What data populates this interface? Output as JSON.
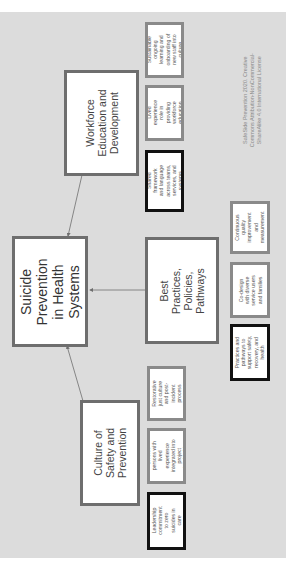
{
  "title": "Suicide Prevention in Health Systems",
  "center": {
    "label": "Suicide Prevention in Health Systems"
  },
  "branches": [
    {
      "label": "Workforce Education and Development",
      "items": [
        {
          "label": "Sustainable ongoing learning and onboarding of new staff into culture",
          "emphasis": false
        },
        {
          "label": "Lived experience role in providing workforce education",
          "emphasis": false
        },
        {
          "label": "Shared framework and language across teams, services, and systems",
          "emphasis": true
        }
      ]
    },
    {
      "label": "Best Practices, Policies, Pathways",
      "items": [
        {
          "label": "Continuous quality improvement and measurement",
          "emphasis": false
        },
        {
          "label": "Co-design with diverse service users and families",
          "emphasis": false
        },
        {
          "label": "Practices and pathways to support safety, recovery, and health",
          "emphasis": true
        }
      ]
    },
    {
      "label": "Culture of Safety and Prevention",
      "items": [
        {
          "label": "Restorative just culture and post-incident process",
          "emphasis": false
        },
        {
          "label": "Diverse persons with lived experience integrated into project leadership",
          "emphasis": false
        },
        {
          "label": "Leadership commitment to zero suicides in care",
          "emphasis": true
        }
      ]
    }
  ],
  "credit": {
    "line1": "SafeSide Prevention 2020. Creative",
    "line2": "Commons Attribution-NonCommercial-",
    "line3": "ShareAlike 4.0 International License"
  },
  "colors": {
    "background": "#dcdcdc",
    "box_fill": "#ffffff",
    "main_border": "#6e6e6e",
    "small_border": "#8a8a8a",
    "emphasis_border": "#111111",
    "connector": "#6e6e6e"
  }
}
